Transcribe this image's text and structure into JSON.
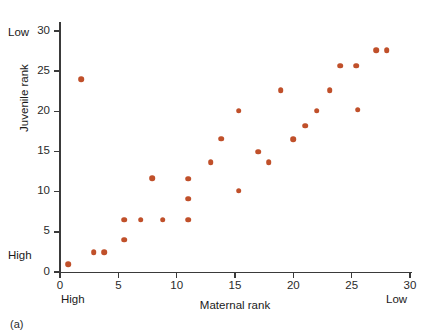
{
  "figure": {
    "panel_label": "(a)"
  },
  "chart_data": {
    "type": "scatter",
    "title": "",
    "xlabel": "Maternal rank",
    "ylabel": "Juvenile rank",
    "xlim": [
      0,
      30
    ],
    "ylim": [
      0,
      30
    ],
    "xticks": [
      0,
      5,
      10,
      15,
      20,
      25,
      30
    ],
    "yticks": [
      0,
      5,
      10,
      15,
      20,
      25,
      30
    ],
    "xtick_labels": [
      "0",
      "5",
      "10",
      "15",
      "20",
      "25",
      "30"
    ],
    "ytick_labels": [
      "0",
      "5",
      "10",
      "15",
      "20",
      "25",
      "30"
    ],
    "grid": false,
    "legend": null,
    "marker_color": "#c0502a",
    "axis_annotations": {
      "y_top": "Low",
      "y_bottom": "High",
      "x_left": "High",
      "x_right": "Low"
    },
    "points": [
      {
        "x": 0.7,
        "y": 1.0
      },
      {
        "x": 1.8,
        "y": 24.0
      },
      {
        "x": 2.9,
        "y": 2.5
      },
      {
        "x": 3.8,
        "y": 2.5
      },
      {
        "x": 5.5,
        "y": 4.0
      },
      {
        "x": 5.5,
        "y": 6.5
      },
      {
        "x": 6.9,
        "y": 6.5
      },
      {
        "x": 7.9,
        "y": 11.7
      },
      {
        "x": 8.8,
        "y": 6.5
      },
      {
        "x": 11.0,
        "y": 6.5
      },
      {
        "x": 11.0,
        "y": 9.1
      },
      {
        "x": 11.0,
        "y": 11.6
      },
      {
        "x": 12.9,
        "y": 13.7
      },
      {
        "x": 13.8,
        "y": 16.6
      },
      {
        "x": 15.3,
        "y": 10.1
      },
      {
        "x": 15.3,
        "y": 20.1
      },
      {
        "x": 17.0,
        "y": 15.0
      },
      {
        "x": 17.9,
        "y": 13.7
      },
      {
        "x": 18.9,
        "y": 22.6
      },
      {
        "x": 20.0,
        "y": 16.5
      },
      {
        "x": 21.0,
        "y": 18.2
      },
      {
        "x": 22.0,
        "y": 20.1
      },
      {
        "x": 23.1,
        "y": 22.6
      },
      {
        "x": 24.0,
        "y": 25.7
      },
      {
        "x": 25.4,
        "y": 25.7
      },
      {
        "x": 25.5,
        "y": 20.2
      },
      {
        "x": 27.1,
        "y": 27.6
      },
      {
        "x": 28.0,
        "y": 27.6
      }
    ]
  }
}
